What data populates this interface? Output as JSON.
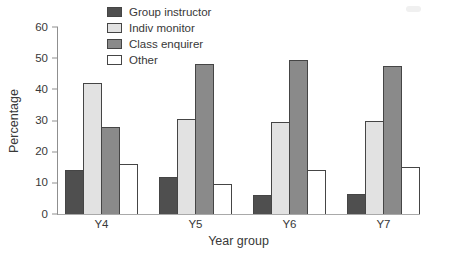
{
  "chart_data": {
    "type": "bar",
    "title": "",
    "xlabel": "Year group",
    "ylabel": "Percentage",
    "categories": [
      "Y4",
      "Y5",
      "Y6",
      "Y7"
    ],
    "series": [
      {
        "name": "Group instructor",
        "color": "#4f4f4f",
        "values": [
          14,
          12,
          6,
          6.5
        ]
      },
      {
        "name": "Indiv monitor",
        "color": "#e2e2e2",
        "values": [
          42,
          30.5,
          29.5,
          30
        ]
      },
      {
        "name": "Class enquirer",
        "color": "#8a8a8a",
        "values": [
          28,
          48,
          49.5,
          47.5
        ]
      },
      {
        "name": "Other",
        "color": "#ffffff",
        "values": [
          16,
          9.5,
          14,
          15
        ]
      }
    ],
    "ylim": [
      0,
      60
    ],
    "yticks": [
      0,
      10,
      20,
      30,
      40,
      50,
      60
    ],
    "grid": false,
    "legend_position": "top-left-inside",
    "bar_border_color": "#454545",
    "axis_color": "#8f8f8f"
  }
}
